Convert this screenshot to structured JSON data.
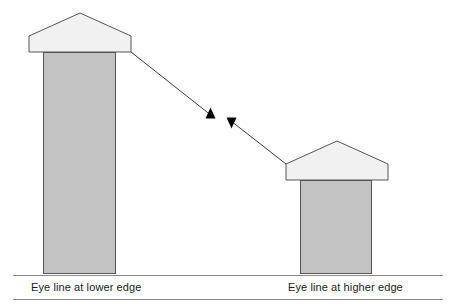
{
  "diagram": {
    "background_color": "#ffffff",
    "stroke_color": "#555555",
    "arrow_color": "#000000",
    "column_fill": "#c3c3c3",
    "roof_fill": "#f1f1f1",
    "ground_line_color": "#8a8a8a",
    "labels": {
      "left": "Eye line at lower edge",
      "right": "Eye line at higher edge"
    },
    "structures": [
      {
        "name": "tall-tower",
        "side": "left",
        "column": {
          "x": 43,
          "y": 52,
          "width": 73,
          "height": 222
        },
        "roof": {
          "apex_x": 80,
          "apex_y": 13,
          "left_x": 29,
          "right_x": 131,
          "shoulder_y": 36,
          "base_y": 52
        }
      },
      {
        "name": "short-tower",
        "side": "right",
        "column": {
          "x": 300,
          "y": 180,
          "width": 72,
          "height": 94
        },
        "roof": {
          "apex_x": 337,
          "apex_y": 141,
          "left_x": 286,
          "right_x": 388,
          "shoulder_y": 164,
          "base_y": 180
        }
      }
    ],
    "sight_lines": [
      {
        "name": "downward-sight-line",
        "from_x": 131,
        "from_y": 52,
        "to_x": 214,
        "to_y": 118,
        "arrow_at": "end",
        "arrow_direction": "down-right"
      },
      {
        "name": "upward-sight-line",
        "from_x": 286,
        "from_y": 164,
        "to_x": 228,
        "to_y": 119,
        "arrow_at": "end",
        "arrow_direction": "up-left"
      }
    ],
    "ground_lines": [
      {
        "name": "eye-line-upper-rule",
        "x1": 13,
        "y1": 275,
        "x2": 443,
        "y2": 275
      },
      {
        "name": "eye-line-lower-rule",
        "x1": 13,
        "y1": 299,
        "x2": 443,
        "y2": 299
      }
    ]
  }
}
